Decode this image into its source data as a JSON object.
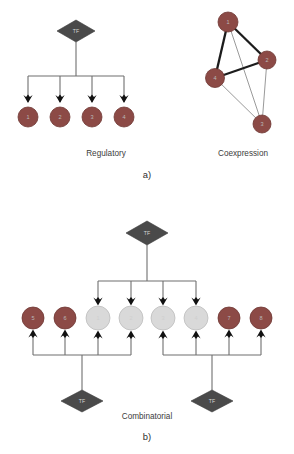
{
  "figure": {
    "background": "#ffffff",
    "colors": {
      "node_dark": "#8c4a46",
      "node_dark_stroke": "#6e3734",
      "node_light": "#d9d9d9",
      "node_light_stroke": "#bdbdbd",
      "tf_fill": "#4a4a4a",
      "tf_stroke": "#3a3a3a",
      "edge_thin": "#8d8d8d",
      "edge_thick": "#1c1c1c",
      "arrow": "#111111",
      "connector": "#6f6f6f",
      "caption_text": "#3c3c3c",
      "panel_text": "#2e2e2e"
    },
    "panels": [
      {
        "id": "panel-a",
        "label": "a)",
        "label_pos": {
          "x": 147,
          "y": 178
        },
        "diagrams": [
          {
            "id": "regulatory",
            "caption": "Regulatory",
            "caption_pos": {
              "x": 106,
              "y": 156
            },
            "type": "regulatory",
            "tf": {
              "label": "TF",
              "x": 76,
              "y": 31,
              "rx": 19,
              "ry": 11
            },
            "trunk": {
              "x": 76,
              "y_top": 42,
              "y_bus": 76
            },
            "bus": {
              "x_left": 28,
              "x_right": 124,
              "y": 76
            },
            "nodes": [
              {
                "label": "1",
                "x": 28,
                "y": 117,
                "r": 10,
                "tone": "dark",
                "stem_top": 76,
                "arrow_y": 102
              },
              {
                "label": "2",
                "x": 60,
                "y": 117,
                "r": 10,
                "tone": "dark",
                "stem_top": 76,
                "arrow_y": 102
              },
              {
                "label": "3",
                "x": 92,
                "y": 117,
                "r": 10,
                "tone": "dark",
                "stem_top": 76,
                "arrow_y": 102
              },
              {
                "label": "4",
                "x": 124,
                "y": 117,
                "r": 10,
                "tone": "dark",
                "stem_top": 76,
                "arrow_y": 102
              }
            ]
          },
          {
            "id": "coexpression",
            "caption": "Coexpression",
            "caption_pos": {
              "x": 243,
              "y": 156
            },
            "type": "coexpression",
            "nodes": [
              {
                "label": "1",
                "x": 228,
                "y": 22,
                "r": 10,
                "tone": "dark"
              },
              {
                "label": "2",
                "x": 267,
                "y": 60,
                "r": 9,
                "tone": "dark"
              },
              {
                "label": "3",
                "x": 262,
                "y": 124,
                "r": 9,
                "tone": "dark"
              },
              {
                "label": "4",
                "x": 215,
                "y": 78,
                "r": 9.5,
                "tone": "dark"
              }
            ],
            "edges": [
              {
                "from": "1",
                "to": "2",
                "weight": "thick"
              },
              {
                "from": "1",
                "to": "4",
                "weight": "thick"
              },
              {
                "from": "2",
                "to": "4",
                "weight": "thick"
              },
              {
                "from": "1",
                "to": "3",
                "weight": "thin"
              },
              {
                "from": "2",
                "to": "3",
                "weight": "thin"
              },
              {
                "from": "4",
                "to": "3",
                "weight": "thin"
              }
            ]
          }
        ]
      },
      {
        "id": "panel-b",
        "label": "b)",
        "label_pos": {
          "x": 147,
          "y": 440
        },
        "diagrams": [
          {
            "id": "combinatorial",
            "caption": "Combinatorial",
            "caption_pos": {
              "x": 147,
              "y": 419
            },
            "type": "combinatorial",
            "top_tf": {
              "label": "TF",
              "x": 147,
              "y": 233,
              "rx": 21,
              "ry": 12
            },
            "top_trunk": {
              "x": 147,
              "y_top": 245,
              "y_bus": 281
            },
            "top_bus": {
              "x_left": 98,
              "x_right": 196,
              "y": 281
            },
            "bottom_tfs": [
              {
                "label": "TF",
                "x": 82,
                "y": 401,
                "rx": 21,
                "ry": 11
              },
              {
                "label": "TF",
                "x": 212,
                "y": 401,
                "rx": 21,
                "ry": 11
              }
            ],
            "bottom_trunks": [
              {
                "x": 82,
                "y_bus": 355,
                "y_tf": 390
              },
              {
                "x": 212,
                "y_bus": 355,
                "y_tf": 390
              }
            ],
            "bottom_buses": [
              {
                "x_left": 33,
                "x_right": 131,
                "y": 355
              },
              {
                "x_left": 163,
                "x_right": 261,
                "y": 355
              }
            ],
            "nodes": [
              {
                "label": "5",
                "x": 33,
                "y": 318,
                "r": 11,
                "tone": "dark",
                "top_arrow": false,
                "bottom_arrow": true,
                "bus_index": 0
              },
              {
                "label": "6",
                "x": 65,
                "y": 318,
                "r": 11,
                "tone": "dark",
                "top_arrow": false,
                "bottom_arrow": true,
                "bus_index": 0
              },
              {
                "label": "1",
                "x": 98,
                "y": 318,
                "r": 12,
                "tone": "light",
                "top_arrow": true,
                "bottom_arrow": true,
                "bus_index": 0
              },
              {
                "label": "2",
                "x": 131,
                "y": 318,
                "r": 12,
                "tone": "light",
                "top_arrow": true,
                "bottom_arrow": true,
                "bus_index": 0
              },
              {
                "label": "3",
                "x": 163,
                "y": 318,
                "r": 12,
                "tone": "light",
                "top_arrow": true,
                "bottom_arrow": true,
                "bus_index": 1
              },
              {
                "label": "4",
                "x": 196,
                "y": 318,
                "r": 12,
                "tone": "light",
                "top_arrow": true,
                "bottom_arrow": true,
                "bus_index": 1
              },
              {
                "label": "7",
                "x": 229,
                "y": 318,
                "r": 11,
                "tone": "dark",
                "top_arrow": false,
                "bottom_arrow": true,
                "bus_index": 1
              },
              {
                "label": "8",
                "x": 261,
                "y": 318,
                "r": 11,
                "tone": "dark",
                "top_arrow": false,
                "bottom_arrow": true,
                "bus_index": 1
              }
            ]
          }
        ]
      }
    ]
  }
}
